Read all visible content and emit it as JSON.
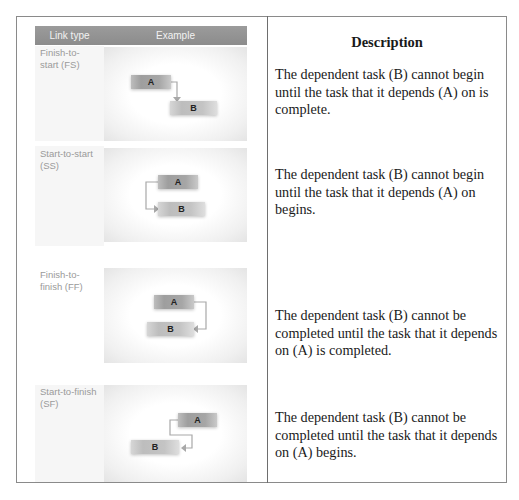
{
  "header": {
    "link_type": "Link type",
    "example": "Example",
    "description": "Description"
  },
  "rows": [
    {
      "label": "Finish-to-start (FS)",
      "label_lines": [
        "Finish-to-",
        "start (FS)"
      ],
      "task_a": "A",
      "task_b": "B",
      "description": "The dependent task (B) cannot begin until the task that it depends (A) on is complete."
    },
    {
      "label": "Start-to-start (SS)",
      "label_lines": [
        "Start-to-start",
        "(SS)"
      ],
      "task_a": "A",
      "task_b": "B",
      "description": "The dependent task (B) cannot begin until the task that it depends (A) on begins."
    },
    {
      "label": "Finish-to-finish (FF)",
      "label_lines": [
        "Finish-to-",
        "finish (FF)"
      ],
      "task_a": "A",
      "task_b": "B",
      "description": "The dependent task (B) cannot be completed until the task that it depends on (A) is completed."
    },
    {
      "label": "Start-to-finish (SF)",
      "label_lines": [
        "Start-to-finish",
        "(SF)"
      ],
      "task_a": "A",
      "task_b": "B",
      "description": "The dependent task (B) cannot be completed until the task that it depends on (A) begins."
    }
  ],
  "colors": {
    "header_band": "#939393",
    "label_text": "#9a9a9a",
    "connector": "#a8a8a8",
    "border": "#7a7a7a"
  }
}
